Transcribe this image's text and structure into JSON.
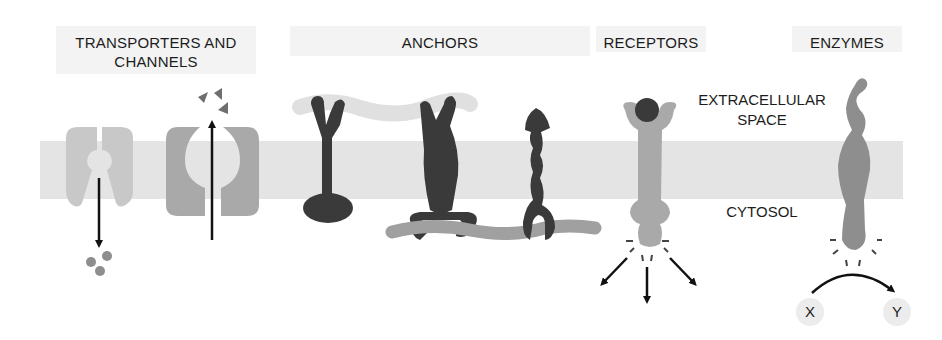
{
  "categories": {
    "transporters": "TRANSPORTERS AND CHANNELS",
    "transporters_line1": "TRANSPORTERS AND",
    "transporters_line2": "CHANNELS",
    "anchors": "ANCHORS",
    "receptors": "RECEPTORS",
    "enzymes": "ENZYMES"
  },
  "regions": {
    "extracellular_line1": "EXTRACELLULAR",
    "extracellular_line2": "SPACE",
    "cytosol": "CYTOSOL"
  },
  "enzyme_reaction": {
    "substrate": "X",
    "product": "Y"
  },
  "colors": {
    "membrane": "#e4e4e4",
    "light_protein": "#c8c8c8",
    "mid_protein": "#a9a9a9",
    "dark_protein": "#3a3a3a",
    "ligand": "#555555"
  }
}
